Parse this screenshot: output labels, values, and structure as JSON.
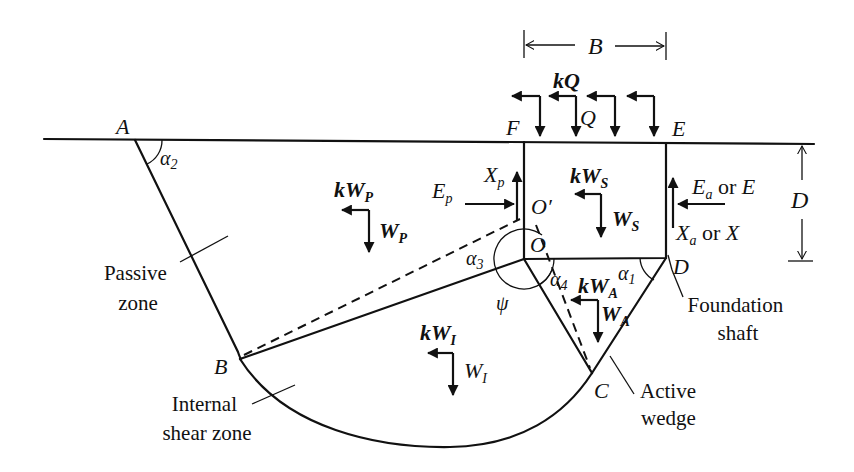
{
  "figure": {
    "title": "",
    "points": {
      "A": "A",
      "B": "B",
      "C": "C",
      "D": "D",
      "E": "E",
      "F": "F",
      "O": "O",
      "O_prime": "O′"
    },
    "angles": {
      "alpha1": "α",
      "alpha1_sub": "1",
      "alpha2": "α",
      "alpha2_sub": "2",
      "alpha3": "α",
      "alpha3_sub": "3",
      "alpha4": "α",
      "alpha4_sub": "4",
      "psi": "ψ"
    },
    "dimensions": {
      "width": "B",
      "depth": "D"
    },
    "forces": {
      "kQ": "kQ",
      "Q": "Q",
      "kWs": "kW",
      "kWs_sub": "S",
      "Ws": "W",
      "Ws_sub": "S",
      "kWp": "kW",
      "kWp_sub": "P",
      "Wp": "W",
      "Wp_sub": "P",
      "kWa": "kW",
      "kWa_sub": "A",
      "Wa": "W",
      "Wa_sub": "A",
      "kW1": "kW",
      "kW1_sub": "I",
      "W1": "W",
      "W1_sub": "I",
      "Ep": "E",
      "Ep_sub": "p",
      "Xp": "X",
      "Xp_sub": "p",
      "Ea": "E",
      "Ea_sub": "a",
      "Ea_or": " or ",
      "Ea_alt": "E",
      "Xa": "X",
      "Xa_sub": "a",
      "Xa_or": " or ",
      "Xa_alt": "X"
    },
    "zone_labels": {
      "passive_line1": "Passive",
      "passive_line2": "zone",
      "shear_line1": "Internal",
      "shear_line2": "shear zone",
      "active_line1": "Active",
      "active_line2": "wedge",
      "shaft_line1": "Foundation",
      "shaft_line2": "shaft"
    }
  }
}
